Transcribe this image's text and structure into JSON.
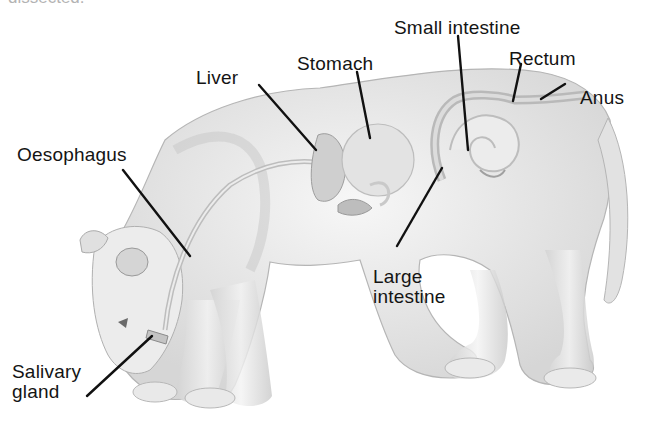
{
  "figure": {
    "top_cutoff_text": "dissected."
  },
  "labels": [
    {
      "id": "small-intestine",
      "text": "Small intestine",
      "x": 394,
      "y": 18
    },
    {
      "id": "rectum",
      "text": "Rectum",
      "x": 509,
      "y": 49
    },
    {
      "id": "stomach",
      "text": "Stomach",
      "x": 297,
      "y": 54
    },
    {
      "id": "liver",
      "text": "Liver",
      "x": 196,
      "y": 68
    },
    {
      "id": "anus",
      "text": "Anus",
      "x": 580,
      "y": 88
    },
    {
      "id": "oesophagus",
      "text": "Oesophagus",
      "x": 17,
      "y": 145
    },
    {
      "id": "large-intestine-1",
      "text": "Large",
      "x": 373,
      "y": 267
    },
    {
      "id": "large-intestine-2",
      "text": "intestine",
      "x": 373,
      "y": 287
    },
    {
      "id": "salivary-1",
      "text": "Salivary",
      "x": 12,
      "y": 362
    },
    {
      "id": "salivary-2",
      "text": "gland",
      "x": 12,
      "y": 382
    }
  ],
  "colors": {
    "line": "#111111",
    "fur_light": "#f1f1f1",
    "fur_mid": "#d9d9d9",
    "fur_dark": "#a8a8a8",
    "organ": "#c8c8c8"
  }
}
